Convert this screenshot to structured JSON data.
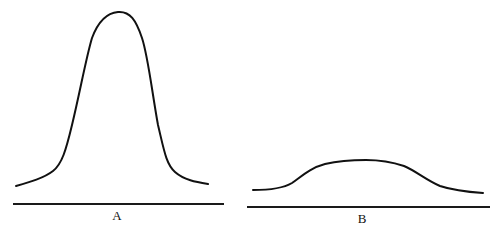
{
  "diagram": {
    "panels": [
      {
        "label": "A",
        "shape": "tall narrow peak",
        "curve_path": "M16,186 C30,182 44,178 53,171 C62,164 66,150 72,125 C80,92 86,58 92,38 C98,22 106,13 118,12 C130,11 136,20 142,38 C148,56 152,92 158,125 C164,150 166,164 175,172 C184,180 196,182 208,184",
        "baseline": {
          "x1": 13,
          "y1": 204,
          "x2": 224,
          "y2": 204
        },
        "label_pos": {
          "x": 117,
          "y": 209
        }
      },
      {
        "label": "B",
        "shape": "low broad hump",
        "curve_path": "M253,190 C265,190 282,189 292,183 C302,176 310,168 325,164 C338,161 352,160 366,160 C380,160 392,162 404,166 C416,171 426,180 440,186 C455,191 468,192 483,193",
        "baseline": {
          "x1": 247,
          "y1": 207,
          "x2": 490,
          "y2": 207
        },
        "label_pos": {
          "x": 362,
          "y": 212
        }
      }
    ],
    "colors": {
      "stroke": "#111111",
      "background": "#ffffff"
    }
  }
}
